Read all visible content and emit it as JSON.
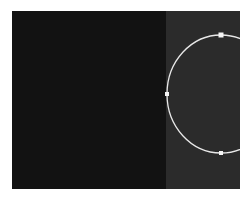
{
  "canvas": {
    "colors": {
      "left_panel": "#121212",
      "right_panel": "#2b2b2b",
      "shape_stroke": "#e8e8e8",
      "handle_fill": "#f5f5f5"
    },
    "shape": {
      "type": "ellipse",
      "center": [
        209,
        83
      ],
      "rx": 54,
      "ry": 59
    },
    "handles": [
      {
        "name": "top",
        "x": 209,
        "y": 24,
        "size": 5
      },
      {
        "name": "left",
        "x": 155,
        "y": 83,
        "size": 4
      },
      {
        "name": "bottom",
        "x": 209,
        "y": 142,
        "size": 4
      }
    ]
  }
}
